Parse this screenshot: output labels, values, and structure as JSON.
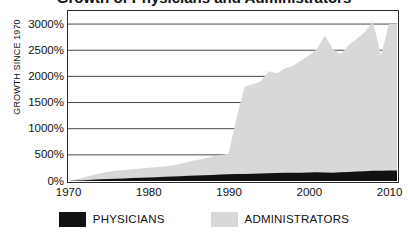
{
  "chart_data": {
    "type": "area",
    "title": "Growth of Physicians and Administrators",
    "title_visible_fragment": "y",
    "xlabel": "",
    "ylabel": "GROWTH SINCE 1970",
    "xlim": [
      1970,
      2011
    ],
    "ylim": [
      0,
      3250
    ],
    "grid": true,
    "grid_axis": "y",
    "legend_position": "bottom",
    "y_ticks": [
      0,
      500,
      1000,
      1500,
      2000,
      2500,
      3000
    ],
    "y_tick_labels": [
      "0%",
      "500%",
      "1000%",
      "1500%",
      "2000%",
      "2500%",
      "3000%"
    ],
    "x_ticks": [
      1970,
      1980,
      1990,
      2000,
      2010
    ],
    "x_tick_labels": [
      "1970",
      "1980",
      "1990",
      "2000",
      "2010"
    ],
    "x": [
      1970,
      1971,
      1972,
      1973,
      1974,
      1975,
      1976,
      1977,
      1978,
      1979,
      1980,
      1981,
      1982,
      1983,
      1984,
      1985,
      1986,
      1987,
      1988,
      1989,
      1990,
      1991,
      1992,
      1993,
      1994,
      1995,
      1996,
      1997,
      1998,
      1999,
      2000,
      2001,
      2002,
      2003,
      2004,
      2005,
      2006,
      2007,
      2008,
      2009,
      2010
    ],
    "series": [
      {
        "name": "ADMINISTRATORS",
        "color": "#d8d8d8",
        "values": [
          0,
          30,
          70,
          110,
          150,
          175,
          195,
          210,
          225,
          240,
          255,
          265,
          275,
          300,
          330,
          370,
          400,
          430,
          470,
          490,
          520,
          1200,
          1800,
          1850,
          1900,
          2100,
          2060,
          2150,
          2200,
          2300,
          2400,
          2520,
          2780,
          2520,
          2430,
          2600,
          2720,
          2850,
          3050,
          2400,
          3000
        ]
      },
      {
        "name": "PHYSICIANS",
        "color": "#111111",
        "values": [
          0,
          8,
          16,
          24,
          32,
          38,
          44,
          50,
          56,
          62,
          68,
          74,
          80,
          86,
          92,
          98,
          104,
          110,
          116,
          122,
          128,
          132,
          136,
          140,
          144,
          148,
          152,
          156,
          158,
          160,
          162,
          165,
          163,
          160,
          165,
          172,
          180,
          188,
          194,
          198,
          200
        ]
      }
    ],
    "annotations": []
  },
  "legend": {
    "entries": [
      {
        "label": "PHYSICIANS",
        "color": "#111111"
      },
      {
        "label": "ADMINISTRATORS",
        "color": "#d8d8d8"
      }
    ]
  },
  "colors": {
    "axis": "#2b2b2b",
    "grid": "#4a4a4a",
    "background": "#ffffff",
    "text": "#111111"
  }
}
